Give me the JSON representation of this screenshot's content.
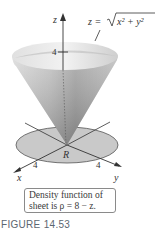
{
  "figure": {
    "caption": "FIGURE 14.53",
    "equation": {
      "lhs": "z = ",
      "radicand": "x² + y²",
      "full": "z = √(x² + y²)"
    },
    "axes": {
      "z_label": "z",
      "x_label": "x",
      "y_label": "y",
      "z_tick": "4",
      "x_tick": "4",
      "y_tick": "4"
    },
    "region_label": "R",
    "callout": {
      "line1": "Density function of",
      "line2": "sheet is ρ = 8 − z."
    }
  },
  "colors": {
    "region_fill": "#c9c9c9",
    "region_stroke": "#555555",
    "cone_light": "#e6e6e6",
    "cone_dark": "#7a7a7a",
    "cone_rim": "#d0d0d0",
    "axis": "#333333",
    "caption": "#5c6670"
  }
}
